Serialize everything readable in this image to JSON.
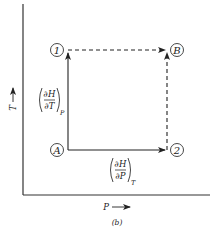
{
  "figure": {
    "caption": "(b)",
    "axes": {
      "x_label": "P",
      "y_label": "T"
    },
    "nodes": [
      {
        "id": "node-1",
        "label": "1",
        "cx": 57,
        "cy": 50
      },
      {
        "id": "node-B",
        "label": "B",
        "cx": 177,
        "cy": 50
      },
      {
        "id": "node-A",
        "label": "A",
        "cx": 57,
        "cy": 150
      },
      {
        "id": "node-2",
        "label": "2",
        "cx": 177,
        "cy": 150
      }
    ],
    "paths": [
      {
        "from": "A",
        "to": "1",
        "style": "solid",
        "label": "dH/dT at P"
      },
      {
        "from": "A",
        "to": "2",
        "style": "solid",
        "label": "dH/dP at T"
      },
      {
        "from": "1",
        "to": "B",
        "style": "dashed"
      },
      {
        "from": "2",
        "to": "B",
        "style": "dashed"
      }
    ],
    "derivatives": {
      "vertical": {
        "numerator": "∂H",
        "denominator": "∂T",
        "subscript": "P"
      },
      "horizontal": {
        "numerator": "∂H",
        "denominator": "∂P",
        "subscript": "T"
      }
    }
  }
}
